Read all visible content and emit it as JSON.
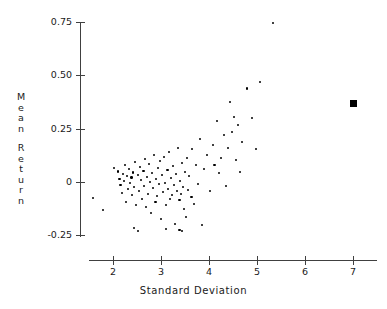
{
  "chart_data": {
    "type": "scatter",
    "title": "",
    "xlabel": "Standard Deviation",
    "ylabel": "Mean Return",
    "xlim": [
      1.4,
      7.5
    ],
    "ylim": [
      -0.3,
      0.78
    ],
    "xticks": [
      2,
      3,
      4,
      5,
      6,
      7
    ],
    "xtick_labels": [
      "2",
      "3",
      "4",
      "5",
      "6",
      "7"
    ],
    "yticks": [
      -0.25,
      0,
      0.25,
      0.5,
      0.75
    ],
    "ytick_labels": [
      "-0.25",
      "0",
      "0.25",
      "0.50",
      "0.75"
    ],
    "grid": false,
    "legend": null,
    "series": [
      {
        "name": "assets",
        "marker": "dot",
        "color": "#000000",
        "points": [
          [
            1.58,
            -0.075
          ],
          [
            1.79,
            -0.132
          ],
          [
            2.02,
            0.066
          ],
          [
            2.1,
            0.049
          ],
          [
            2.13,
            0.014
          ],
          [
            2.16,
            -0.014
          ],
          [
            2.19,
            -0.052
          ],
          [
            2.21,
            0.038
          ],
          [
            2.23,
            0.005
          ],
          [
            2.25,
            0.079
          ],
          [
            2.27,
            -0.094
          ],
          [
            2.29,
            0.028
          ],
          [
            2.31,
            -0.033
          ],
          [
            2.33,
            0.061
          ],
          [
            2.35,
            -0.005
          ],
          [
            2.38,
            0.02
          ],
          [
            2.4,
            -0.061
          ],
          [
            2.42,
            0.045
          ],
          [
            2.44,
            -0.024
          ],
          [
            2.46,
            0.094
          ],
          [
            2.48,
            -0.108
          ],
          [
            2.52,
            0.033
          ],
          [
            2.54,
            -0.042
          ],
          [
            2.56,
            0.071
          ],
          [
            2.58,
            0.009
          ],
          [
            2.6,
            -0.08
          ],
          [
            2.63,
            0.052
          ],
          [
            2.65,
            -0.019
          ],
          [
            2.67,
            0.108
          ],
          [
            2.69,
            -0.118
          ],
          [
            2.71,
            0.024
          ],
          [
            2.73,
            -0.056
          ],
          [
            2.75,
            0.085
          ],
          [
            2.77,
            0.0
          ],
          [
            2.79,
            -0.146
          ],
          [
            2.81,
            0.042
          ],
          [
            2.83,
            -0.028
          ],
          [
            2.85,
            0.127
          ],
          [
            2.88,
            -0.094
          ],
          [
            2.9,
            0.014
          ],
          [
            2.92,
            -0.066
          ],
          [
            2.94,
            0.066
          ],
          [
            2.96,
            -0.009
          ],
          [
            2.98,
            0.099
          ],
          [
            3.0,
            -0.174
          ],
          [
            3.02,
            0.033
          ],
          [
            3.04,
            -0.047
          ],
          [
            3.06,
            0.118
          ],
          [
            3.08,
            -0.005
          ],
          [
            3.1,
            -0.108
          ],
          [
            3.13,
            0.056
          ],
          [
            3.15,
            -0.033
          ],
          [
            3.17,
            0.141
          ],
          [
            3.19,
            -0.08
          ],
          [
            3.21,
            0.019
          ],
          [
            3.23,
            -0.061
          ],
          [
            3.25,
            0.075
          ],
          [
            3.27,
            -0.014
          ],
          [
            3.29,
            -0.197
          ],
          [
            3.31,
            0.038
          ],
          [
            3.33,
            -0.042
          ],
          [
            3.35,
            0.16
          ],
          [
            3.38,
            -0.085
          ],
          [
            3.4,
            0.005
          ],
          [
            3.42,
            -0.056
          ],
          [
            3.44,
            0.09
          ],
          [
            3.46,
            -0.024
          ],
          [
            3.48,
            -0.127
          ],
          [
            3.5,
            0.047
          ],
          [
            3.52,
            -0.165
          ],
          [
            3.54,
            0.113
          ],
          [
            3.56,
            -0.038
          ],
          [
            3.58,
            0.028
          ],
          [
            3.63,
            -0.071
          ],
          [
            3.65,
            0.155
          ],
          [
            3.69,
            -0.104
          ],
          [
            3.73,
            0.08
          ],
          [
            3.77,
            -0.009
          ],
          [
            3.81,
            0.202
          ],
          [
            3.85,
            -0.202
          ],
          [
            3.9,
            0.061
          ],
          [
            3.96,
            0.127
          ],
          [
            4.02,
            -0.042
          ],
          [
            4.08,
            0.174
          ],
          [
            4.12,
            0.08
          ],
          [
            4.17,
            0.286
          ],
          [
            4.21,
            0.042
          ],
          [
            4.25,
            0.113
          ],
          [
            4.31,
            0.221
          ],
          [
            4.35,
            -0.019
          ],
          [
            4.4,
            0.159
          ],
          [
            4.44,
            0.375
          ],
          [
            4.48,
            0.234
          ],
          [
            4.52,
            0.305
          ],
          [
            4.56,
            0.103
          ],
          [
            4.6,
            0.268
          ],
          [
            4.65,
            0.047
          ],
          [
            4.69,
            0.188
          ],
          [
            4.79,
            0.437
          ],
          [
            4.9,
            0.3
          ],
          [
            4.98,
            0.155
          ],
          [
            5.06,
            0.469
          ],
          [
            5.33,
            0.745
          ],
          [
            2.44,
            -0.216
          ],
          [
            2.52,
            -0.23
          ],
          [
            3.1,
            -0.221
          ],
          [
            3.38,
            -0.225
          ],
          [
            3.44,
            -0.23
          ]
        ]
      },
      {
        "name": "portfolio",
        "marker": "square",
        "color": "#000000",
        "points": [
          [
            7.0,
            0.37
          ]
        ]
      }
    ]
  },
  "axes": {
    "x_title": "Standard Deviation",
    "y_title_words": [
      "Mean",
      "Return"
    ]
  }
}
